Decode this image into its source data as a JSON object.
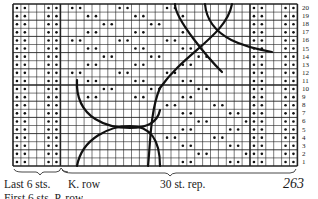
{
  "chart_title": "Knitting stitch chart",
  "grid": {
    "columns": 36,
    "rows": 20,
    "left": 13,
    "top": 4,
    "cell_w": 7.9,
    "cell_h": 8.1,
    "line_color": "#222222",
    "dot_color": "#111111"
  },
  "row_numbers": [
    "20",
    "19",
    "18",
    "17",
    "16",
    "15",
    "14",
    "13",
    "12",
    "11",
    "10",
    "9",
    "8",
    "7",
    "6",
    "5",
    "4",
    "3",
    "2",
    "1"
  ],
  "labels": {
    "last_sts": "Last 6 sts.",
    "k_row": "K. row",
    "repeat": "30 st. rep.",
    "first_sts_partial": "First 6 sts.  P. row",
    "page_number": "263"
  },
  "legend": {
    "dot": "purl stitch (dot)",
    "blank": "knit stitch (blank)",
    "curve": "cable/wave line"
  },
  "chart_data": {
    "type": "table",
    "xlabel": "Stitches (Last 6 sts. | 30 st. rep.)",
    "ylabel": "Rows 1-20",
    "row_labels": [
      "1",
      "2",
      "3",
      "4",
      "5",
      "6",
      "7",
      "8",
      "9",
      "10",
      "11",
      "12",
      "13",
      "14",
      "15",
      "16",
      "17",
      "18",
      "19",
      "20"
    ],
    "edge_columns_dotted": [
      0,
      1,
      4,
      5,
      30,
      31,
      34,
      35
    ],
    "repeat_columns": [
      6,
      35
    ]
  }
}
